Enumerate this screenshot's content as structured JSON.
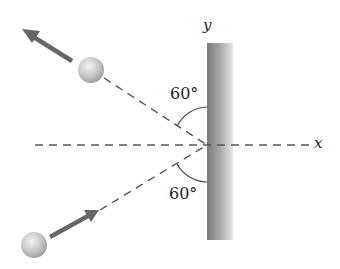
{
  "diagram": {
    "axes": {
      "x_label": "x",
      "y_label": "y"
    },
    "angles": {
      "incident_label": "60°",
      "reflected_label": "60°"
    },
    "elements": {
      "wall": "vertical wall along y-axis",
      "incoming_ball": "ball moving toward wall from lower left",
      "outgoing_ball": "ball moving away from wall toward upper left"
    },
    "colors": {
      "line": "#555555",
      "arrow": "#666666",
      "wall_dark": "#7a7a7a",
      "wall_light": "#e2e2e2",
      "ball": "#c8c8c8"
    }
  }
}
